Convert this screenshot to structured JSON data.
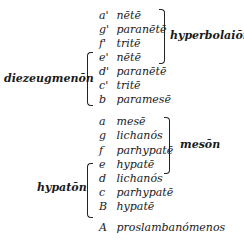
{
  "rows": [
    {
      "note": "a'",
      "name": "nētē"
    },
    {
      "note": "g'",
      "name": "paranētē"
    },
    {
      "note": "f'",
      "name": "tritē"
    },
    {
      "note": "e'",
      "name": "nētē"
    },
    {
      "note": "d'",
      "name": "paranētē"
    },
    {
      "note": "c'",
      "name": "tritē"
    },
    {
      "note": "b",
      "name": "paramesē"
    },
    {
      "note": "a",
      "name": "mesē"
    },
    {
      "note": "g",
      "name": "lichanós"
    },
    {
      "note": "f",
      "name": "parhypatē"
    },
    {
      "note": "e",
      "name": "hypatē"
    },
    {
      "note": "d",
      "name": "lichanós"
    },
    {
      "note": "c",
      "name": "parhypatē"
    },
    {
      "note": "B",
      "name": "hypatē"
    },
    {
      "note": "A",
      "name": "proslambanómenos"
    }
  ],
  "groups": {
    "hyperbolaion": "hyperbolaiōn",
    "diezeugmenon": "diezeugmenōn",
    "meson": "mesōn",
    "hypaton": "hypatōn"
  }
}
